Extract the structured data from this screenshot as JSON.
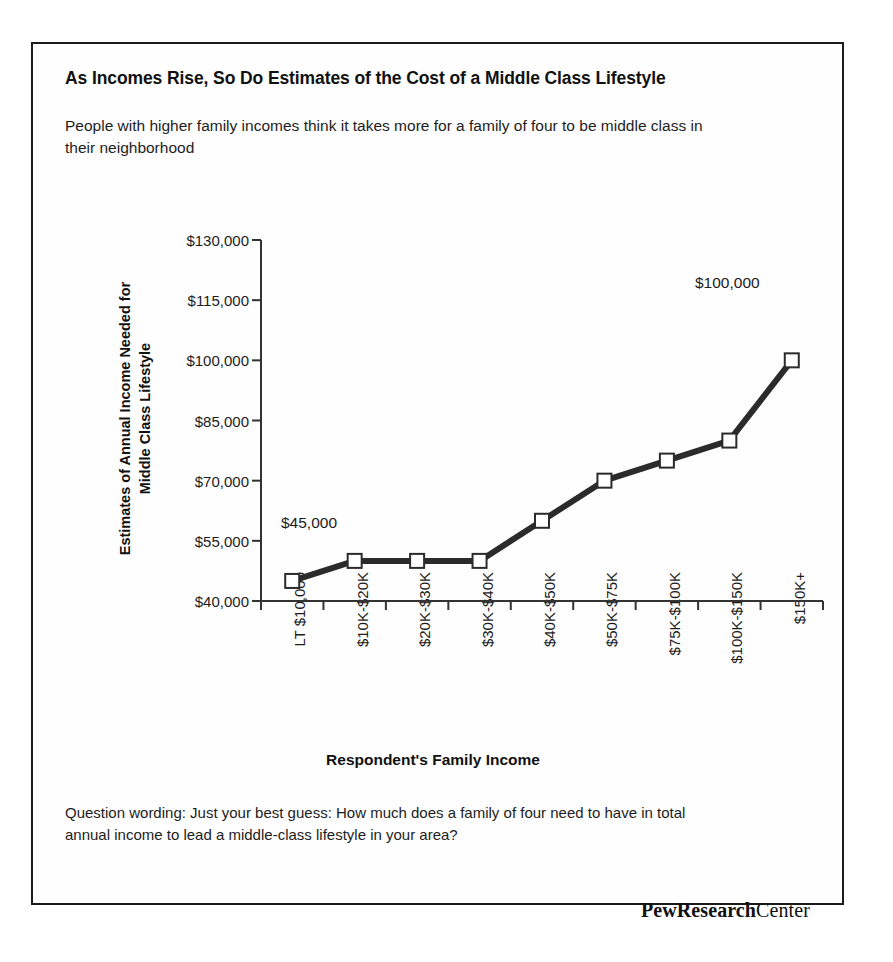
{
  "figure": {
    "title": "As Incomes Rise, So Do Estimates of the Cost of a Middle Class Lifestyle",
    "subtitle": "People with higher family incomes think it takes more for a family of four to be middle class in their neighborhood",
    "footnote": "Question wording: Just your best guess: How much does a family of four need to have in total annual income to lead a middle-class lifestyle in your area?",
    "brand_strong": "PewResearch",
    "brand_light": "Center"
  },
  "chart_data": {
    "type": "line",
    "title": "As Incomes Rise, So Do Estimates of the Cost of a Middle Class Lifestyle",
    "subtitle": "People with higher family incomes think it takes more for a family of four to be middle class in their neighborhood",
    "xlabel": "Respondent's Family Income",
    "ylabel": "Estimates of Annual Income Needed for Middle Class Lifestyle",
    "ylabel_line1": "Estimates of Annual Income Needed for",
    "ylabel_line2": "Middle Class Lifestyle",
    "categories": [
      "LT $10,000",
      "$10K-$20K",
      "$20K-$30K",
      "$30K-$40K",
      "$40K-$50K",
      "$50K-$75K",
      "$75K-$100K",
      "$100K-$150K",
      "$150K+"
    ],
    "values": [
      45000,
      50000,
      50000,
      50000,
      60000,
      70000,
      75000,
      80000,
      100000
    ],
    "ylim": [
      40000,
      130000
    ],
    "ytick_values": [
      130000,
      115000,
      100000,
      85000,
      70000,
      55000,
      40000
    ],
    "ytick_labels": [
      "$130,000",
      "$115,000",
      "$100,000",
      "$85,000",
      "$70,000",
      "$55,000",
      "$40,000"
    ],
    "annotations": [
      {
        "point_index": 0,
        "text": "$45,000"
      },
      {
        "point_index": 8,
        "text": "$100,000"
      }
    ],
    "grid": false,
    "legend": false,
    "series_color": "#2b2b2b",
    "marker": "open-square",
    "marker_fill": "#ffffff"
  }
}
